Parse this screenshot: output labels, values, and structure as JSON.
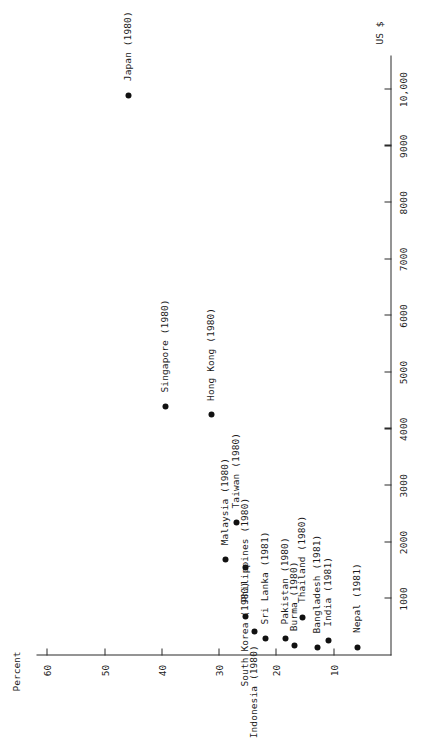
{
  "figure": {
    "x_axis": {
      "title": "US $",
      "ticks": [
        1000,
        2000,
        3000,
        4000,
        5000,
        6000,
        7000,
        8000,
        9000,
        10000
      ],
      "tick_labels": [
        "1000",
        "2000",
        "3000",
        "4000",
        "5000",
        "6000",
        "7000",
        "8000",
        "9000",
        "10,000"
      ],
      "range": [
        0,
        10600
      ]
    },
    "y_axis": {
      "title": "Percent",
      "ticks": [
        10,
        20,
        30,
        40,
        50,
        60
      ],
      "tick_labels": [
        "10",
        "20",
        "30",
        "40",
        "50",
        "60"
      ],
      "range": [
        0,
        62
      ]
    }
  },
  "chart_data": {
    "type": "scatter",
    "title": "",
    "xlabel": "US $",
    "ylabel": "Percent",
    "xlim": [
      0,
      10600
    ],
    "ylim": [
      0,
      62
    ],
    "grid": false,
    "legend": null,
    "points": [
      {
        "label": "Japan (1980)",
        "x": 9900,
        "y": 46,
        "lx": 14,
        "ly": -4
      },
      {
        "label": "Singapore (1980)",
        "x": 4400,
        "y": 39.5,
        "lx": 14,
        "ly": -4
      },
      {
        "label": "Hong Kong (1980)",
        "x": 4250,
        "y": 31.5,
        "lx": 14,
        "ly": -4
      },
      {
        "label": "Taiwan (1980)",
        "x": 2350,
        "y": 27,
        "lx": 14,
        "ly": -4
      },
      {
        "label": "Malaysia (1980)",
        "x": 1700,
        "y": 29,
        "lx": 14,
        "ly": -4
      },
      {
        "label": "South Korea (1980)",
        "x": 1550,
        "y": 25.5,
        "lx": -14,
        "ly": -4,
        "anchor": "end"
      },
      {
        "label": "Philippines (1980)",
        "x": 690,
        "y": 25.5,
        "lx": 14,
        "ly": -4
      },
      {
        "label": "Indonesia (1980)",
        "x": 430,
        "y": 24,
        "lx": -14,
        "ly": -4,
        "anchor": "end"
      },
      {
        "label": "Sri Lanka (1981)",
        "x": 300,
        "y": 22,
        "lx": 14,
        "ly": -4
      },
      {
        "label": "Pakistan (1980)",
        "x": 300,
        "y": 18.5,
        "lx": 14,
        "ly": -4
      },
      {
        "label": "Burma (1980)",
        "x": 180,
        "y": 17,
        "lx": 14,
        "ly": -4
      },
      {
        "label": "Thailand (1980)",
        "x": 680,
        "y": 15.5,
        "lx": 14,
        "ly": -4
      },
      {
        "label": "Bangladesh (1981)",
        "x": 140,
        "y": 13,
        "lx": 14,
        "ly": -4
      },
      {
        "label": "India (1981)",
        "x": 260,
        "y": 11,
        "lx": 14,
        "ly": -4
      },
      {
        "label": "Nepal (1981)",
        "x": 150,
        "y": 6,
        "lx": 14,
        "ly": -4
      }
    ]
  }
}
